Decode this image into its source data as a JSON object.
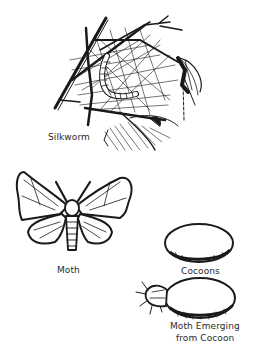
{
  "figure": {
    "background": "#ffffff",
    "ink_color": "#1a1a1a",
    "panels": [
      {
        "id": "silkworm",
        "label": "Silkworm",
        "subject": "silkworm larva spinning on twig web"
      },
      {
        "id": "moth",
        "label": "Moth",
        "subject": "adult silk moth, wings spread"
      },
      {
        "id": "cocoons",
        "label": "Cocoons",
        "subject": "oval cocoon"
      },
      {
        "id": "emerging",
        "label_line1": "Moth Emerging",
        "label_line2": "from Cocoon",
        "subject": "moth emerging from cocoon"
      }
    ]
  }
}
